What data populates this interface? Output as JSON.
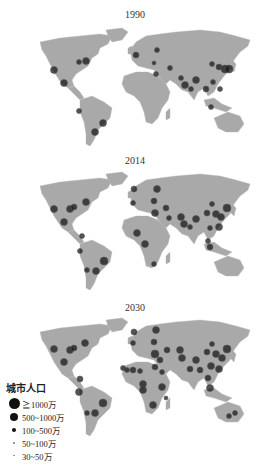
{
  "colors": {
    "land": "#a9a9a9",
    "ocean": "#ffffff",
    "city": "#1a1a1a",
    "text": "#333333"
  },
  "panels": [
    {
      "year": "1990",
      "cities": [
        {
          "x": 54,
          "y": 70,
          "r": 3.5
        },
        {
          "x": 64,
          "y": 83,
          "r": 3.5
        },
        {
          "x": 79,
          "y": 62,
          "r": 2.5
        },
        {
          "x": 86,
          "y": 61,
          "r": 3.5
        },
        {
          "x": 79,
          "y": 111,
          "r": 2.5
        },
        {
          "x": 103,
          "y": 123,
          "r": 3.5
        },
        {
          "x": 95,
          "y": 132,
          "r": 3.5
        },
        {
          "x": 136,
          "y": 55,
          "r": 3
        },
        {
          "x": 157,
          "y": 50,
          "r": 2.5
        },
        {
          "x": 154,
          "y": 63,
          "r": 2
        },
        {
          "x": 156,
          "y": 74,
          "r": 2.5
        },
        {
          "x": 170,
          "y": 68,
          "r": 2.5
        },
        {
          "x": 181,
          "y": 78,
          "r": 2.5
        },
        {
          "x": 185,
          "y": 85,
          "r": 3.5
        },
        {
          "x": 191,
          "y": 89,
          "r": 2.5
        },
        {
          "x": 196,
          "y": 80,
          "r": 3.5
        },
        {
          "x": 206,
          "y": 89,
          "r": 3
        },
        {
          "x": 213,
          "y": 82,
          "r": 2.5
        },
        {
          "x": 212,
          "y": 64,
          "r": 2.5
        },
        {
          "x": 219,
          "y": 67,
          "r": 3
        },
        {
          "x": 225,
          "y": 69,
          "r": 4
        },
        {
          "x": 229,
          "y": 69,
          "r": 4
        },
        {
          "x": 220,
          "y": 89,
          "r": 2.5
        },
        {
          "x": 211,
          "y": 107,
          "r": 2.5
        }
      ]
    },
    {
      "year": "2014",
      "cities": [
        {
          "x": 54,
          "y": 65,
          "r": 3.5
        },
        {
          "x": 64,
          "y": 78,
          "r": 3.5
        },
        {
          "x": 70,
          "y": 65,
          "r": 3.5
        },
        {
          "x": 74,
          "y": 63,
          "r": 3
        },
        {
          "x": 86,
          "y": 58,
          "r": 3.5
        },
        {
          "x": 82,
          "y": 92,
          "r": 2.5
        },
        {
          "x": 80,
          "y": 107,
          "r": 2.5
        },
        {
          "x": 104,
          "y": 117,
          "r": 4
        },
        {
          "x": 96,
          "y": 127,
          "r": 3.5
        },
        {
          "x": 87,
          "y": 126,
          "r": 2.5
        },
        {
          "x": 134,
          "y": 45,
          "r": 3
        },
        {
          "x": 133,
          "y": 59,
          "r": 2.5
        },
        {
          "x": 157,
          "y": 45,
          "r": 3.5
        },
        {
          "x": 154,
          "y": 57,
          "r": 3
        },
        {
          "x": 155,
          "y": 69,
          "r": 3.5
        },
        {
          "x": 166,
          "y": 64,
          "r": 3
        },
        {
          "x": 169,
          "y": 74,
          "r": 2.5
        },
        {
          "x": 137,
          "y": 89,
          "r": 3.5
        },
        {
          "x": 145,
          "y": 100,
          "r": 3.5
        },
        {
          "x": 154,
          "y": 120,
          "r": 2.5
        },
        {
          "x": 181,
          "y": 73,
          "r": 3.5
        },
        {
          "x": 184,
          "y": 80,
          "r": 3.5
        },
        {
          "x": 190,
          "y": 83,
          "r": 2.5
        },
        {
          "x": 196,
          "y": 75,
          "r": 3.5
        },
        {
          "x": 207,
          "y": 69,
          "r": 3
        },
        {
          "x": 210,
          "y": 84,
          "r": 2.5
        },
        {
          "x": 212,
          "y": 60,
          "r": 2.5
        },
        {
          "x": 216,
          "y": 70,
          "r": 3.5
        },
        {
          "x": 221,
          "y": 73,
          "r": 3.5
        },
        {
          "x": 227,
          "y": 64,
          "r": 4
        },
        {
          "x": 219,
          "y": 83,
          "r": 3.5
        },
        {
          "x": 208,
          "y": 97,
          "r": 2.5
        },
        {
          "x": 210,
          "y": 103,
          "r": 3
        }
      ]
    },
    {
      "year": "2030",
      "cities": [
        {
          "x": 54,
          "y": 59,
          "r": 3.5
        },
        {
          "x": 64,
          "y": 72,
          "r": 3.5
        },
        {
          "x": 70,
          "y": 60,
          "r": 3.5
        },
        {
          "x": 74,
          "y": 58,
          "r": 3
        },
        {
          "x": 85,
          "y": 53,
          "r": 3.5
        },
        {
          "x": 80,
          "y": 89,
          "r": 3
        },
        {
          "x": 79,
          "y": 102,
          "r": 3.5
        },
        {
          "x": 103,
          "y": 113,
          "r": 4
        },
        {
          "x": 95,
          "y": 123,
          "r": 3.5
        },
        {
          "x": 87,
          "y": 123,
          "r": 2.5
        },
        {
          "x": 134,
          "y": 42,
          "r": 3
        },
        {
          "x": 133,
          "y": 53,
          "r": 2.5
        },
        {
          "x": 156,
          "y": 40,
          "r": 3.5
        },
        {
          "x": 154,
          "y": 52,
          "r": 3
        },
        {
          "x": 155,
          "y": 64,
          "r": 4
        },
        {
          "x": 160,
          "y": 70,
          "r": 3
        },
        {
          "x": 167,
          "y": 60,
          "r": 3
        },
        {
          "x": 123,
          "y": 78,
          "r": 2.5
        },
        {
          "x": 127,
          "y": 80,
          "r": 2.5
        },
        {
          "x": 133,
          "y": 80,
          "r": 3
        },
        {
          "x": 140,
          "y": 81,
          "r": 2.5
        },
        {
          "x": 155,
          "y": 77,
          "r": 3
        },
        {
          "x": 162,
          "y": 82,
          "r": 2.5
        },
        {
          "x": 143,
          "y": 94,
          "r": 3.5
        },
        {
          "x": 143,
          "y": 100,
          "r": 3.5
        },
        {
          "x": 162,
          "y": 97,
          "r": 3.5
        },
        {
          "x": 153,
          "y": 115,
          "r": 3.5
        },
        {
          "x": 166,
          "y": 108,
          "r": 2
        },
        {
          "x": 180,
          "y": 60,
          "r": 3.5
        },
        {
          "x": 182,
          "y": 68,
          "r": 3.5
        },
        {
          "x": 190,
          "y": 79,
          "r": 3
        },
        {
          "x": 196,
          "y": 70,
          "r": 3.5
        },
        {
          "x": 200,
          "y": 80,
          "r": 3
        },
        {
          "x": 207,
          "y": 62,
          "r": 3
        },
        {
          "x": 211,
          "y": 76,
          "r": 3.5
        },
        {
          "x": 212,
          "y": 54,
          "r": 2.5
        },
        {
          "x": 216,
          "y": 64,
          "r": 3.5
        },
        {
          "x": 222,
          "y": 68,
          "r": 3.5
        },
        {
          "x": 227,
          "y": 59,
          "r": 4
        },
        {
          "x": 219,
          "y": 79,
          "r": 3.5
        },
        {
          "x": 208,
          "y": 88,
          "r": 3
        },
        {
          "x": 210,
          "y": 98,
          "r": 3.5
        },
        {
          "x": 229,
          "y": 126,
          "r": 2.5
        },
        {
          "x": 235,
          "y": 123,
          "r": 2.5
        }
      ]
    }
  ],
  "legend": {
    "title": "城市人口",
    "items": [
      {
        "label": "≧1000万",
        "size": 9
      },
      {
        "label": "500~1000万",
        "size": 7
      },
      {
        "label": "100~500万",
        "size": 4
      },
      {
        "label": "50~100万",
        "size": 2.5
      },
      {
        "label": "30~50万",
        "size": 1.5
      }
    ]
  }
}
